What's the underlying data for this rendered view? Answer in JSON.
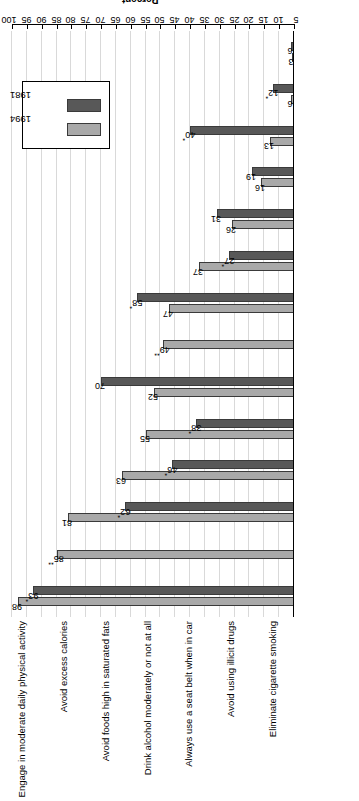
{
  "chart_data": {
    "type": "bar",
    "title": "",
    "subtitle": "",
    "xlabel": "",
    "ylabel": "Percent",
    "ylim": [
      5,
      100
    ],
    "ytick_step": 5,
    "yticks": [
      5,
      10,
      15,
      20,
      25,
      30,
      35,
      40,
      45,
      50,
      55,
      60,
      65,
      70,
      75,
      80,
      85,
      90,
      95,
      100
    ],
    "grid": true,
    "orientation": "horizontal-rotated",
    "legend_position": "upper-right",
    "legend": [
      "1994",
      "1981"
    ],
    "colors": {
      "1994": "#a9a9a9",
      "1981": "#585858"
    },
    "categories": [
      "Eliminate cigarette smoking",
      "Avoid using illicit drugs",
      "Always use a seat belt when in car",
      "Drink alcohol moderately or not at all",
      "Avoid foods high in saturated fats",
      "Avoid excess calories",
      "Engage in moderate daily physical activity",
      "Eat a balanced diet",
      "Engage in aerobic activity at least 3 times per week",
      "Avoid undue stress",
      "Have an annual physical examination",
      "Decrease salt consumption",
      "Minimize sugar intake",
      "Have a baseline exercise test"
    ],
    "series": [
      {
        "name": "1994",
        "values": [
          98,
          85,
          81,
          63,
          55,
          52,
          49,
          47,
          37,
          26,
          16,
          13,
          6,
          3
        ]
      },
      {
        "name": "1981",
        "values": [
          93,
          null,
          62,
          46,
          38,
          70,
          null,
          58,
          27,
          31,
          19,
          40,
          12,
          6
        ]
      }
    ],
    "point_labels": {
      "1994": [
        "98",
        "85**",
        "81",
        "63",
        "55",
        "52",
        "49**",
        "47",
        "37",
        "26",
        "16",
        "13",
        "6",
        "3"
      ],
      "1981": [
        "93*",
        null,
        "62*",
        "46*",
        "38*",
        "70",
        null,
        "58*",
        "27*",
        "31",
        "19",
        "40*",
        "12*",
        "6"
      ]
    }
  }
}
